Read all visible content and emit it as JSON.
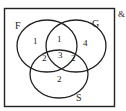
{
  "diagram": {
    "type": "venn",
    "universal_symbol": "&",
    "sets": [
      {
        "name": "F",
        "label": "F"
      },
      {
        "name": "G",
        "label": "G"
      },
      {
        "name": "S",
        "label": "S"
      }
    ],
    "regions": {
      "F_only": "1",
      "F_and_G_only": "1",
      "G_only": "4",
      "F_and_S_only": "2",
      "F_and_G_and_S": "3",
      "G_and_S_only": "2",
      "S_only": "2"
    },
    "colors": {
      "stroke": "#222222",
      "background": "#ffffff"
    }
  }
}
